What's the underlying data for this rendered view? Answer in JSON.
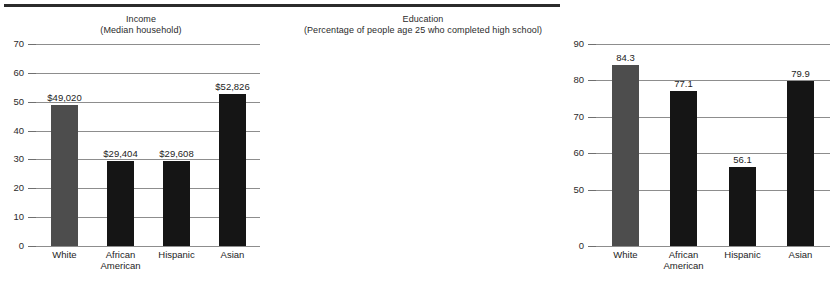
{
  "figure": {
    "top_rule": "horizontal-rule"
  },
  "charts": [
    {
      "id": "income",
      "title_line1": "Income",
      "title_line2": "(Median household)",
      "type": "bar",
      "categories": [
        "White",
        "African American",
        "Hispanic",
        "Asian"
      ],
      "category_lines": [
        [
          "White"
        ],
        [
          "African",
          "American"
        ],
        [
          "Hispanic"
        ],
        [
          "Asian"
        ]
      ],
      "values": [
        49.02,
        29.404,
        29.608,
        52.826
      ],
      "data_labels": [
        "$49,020",
        "$29,404",
        "$29,608",
        "$52,826"
      ],
      "bar_colors": [
        "#4d4d4d",
        "#151515",
        "#151515",
        "#151515"
      ],
      "yticks": [
        0,
        10,
        20,
        30,
        40,
        50,
        60,
        70
      ],
      "ytick_labels": [
        "0",
        "10",
        "20",
        "30",
        "40",
        "50",
        "60",
        "70"
      ],
      "ylim": [
        0,
        70
      ],
      "broken_axis": false,
      "grid": true,
      "xlabel": "",
      "ylabel": ""
    },
    {
      "id": "education",
      "title_line1": "Education",
      "title_line2": "(Percentage of people age 25 who completed high school)",
      "type": "bar",
      "categories": [
        "White",
        "African American",
        "Hispanic",
        "Asian"
      ],
      "category_lines": [
        [
          "White"
        ],
        [
          "African",
          "American"
        ],
        [
          "Hispanic"
        ],
        [
          "Asian"
        ]
      ],
      "values": [
        84.3,
        77.1,
        56.1,
        79.9
      ],
      "data_labels": [
        "84.3",
        "77.1",
        "56.1",
        "79.9"
      ],
      "bar_colors": [
        "#4d4d4d",
        "#151515",
        "#151515",
        "#151515"
      ],
      "yticks": [
        0,
        50,
        60,
        70,
        80,
        90
      ],
      "ytick_labels": [
        "0",
        "50",
        "60",
        "70",
        "80",
        "90"
      ],
      "ylim": [
        0,
        90
      ],
      "broken_axis": true,
      "grid": true,
      "xlabel": "",
      "ylabel": ""
    }
  ],
  "chart_data": [
    {
      "type": "bar",
      "title": "Income (Median household)",
      "categories": [
        "White",
        "African American",
        "Hispanic",
        "Asian"
      ],
      "values": [
        49020,
        29404,
        29608,
        52826
      ],
      "axis_values": [
        49.02,
        29.404,
        29.608,
        52.826
      ],
      "data_labels": [
        "$49,020",
        "$29,404",
        "$29,608",
        "$52,826"
      ],
      "xlabel": "",
      "ylabel": "",
      "ylim": [
        0,
        70
      ],
      "yticks": [
        0,
        10,
        20,
        30,
        40,
        50,
        60,
        70
      ],
      "units": "thousands of dollars",
      "grid": true,
      "legend": "none"
    },
    {
      "type": "bar",
      "title": "Education (Percentage of people age 25 who completed high school)",
      "categories": [
        "White",
        "African American",
        "Hispanic",
        "Asian"
      ],
      "values": [
        84.3,
        77.1,
        56.1,
        79.9
      ],
      "data_labels": [
        "84.3",
        "77.1",
        "56.1",
        "79.9"
      ],
      "xlabel": "",
      "ylabel": "",
      "ylim": [
        0,
        90
      ],
      "yticks": [
        0,
        50,
        60,
        70,
        80,
        90
      ],
      "units": "percent",
      "grid": true,
      "legend": "none",
      "note": "y-axis is broken between 0 and 50"
    }
  ]
}
